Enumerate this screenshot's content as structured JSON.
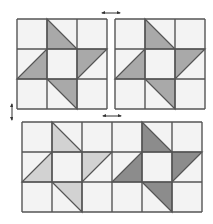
{
  "colors": {
    "background": "#ffffff",
    "cell": "#f3f3f3",
    "line": "#555555",
    "arrow": "#333333",
    "top_shade": "#a9a9a9",
    "bottom_left_shade": "#d2d2d2",
    "bottom_right_shade": "#8c8c8c"
  },
  "blocks": [
    {
      "name": "top-left-block",
      "x": 17,
      "y": 19,
      "cols": 3,
      "rows": 3,
      "cell": 30,
      "shade": "#a9a9a9"
    },
    {
      "name": "top-right-block",
      "x": 115,
      "y": 19,
      "cols": 3,
      "rows": 3,
      "cell": 30,
      "shade": "#a9a9a9"
    },
    {
      "name": "bottom-block",
      "x": 22,
      "y": 122,
      "cols": 6,
      "rows": 3,
      "cell": 30,
      "shade_left": "#d2d2d2",
      "shade_right": "#8c8c8c"
    }
  ],
  "pinwheel_triangles": [
    {
      "col": 1,
      "row": 0,
      "shape": "TL-BR-BL"
    },
    {
      "col": 0,
      "row": 1,
      "shape": "BL-TR-BR"
    },
    {
      "col": 2,
      "row": 1,
      "shape": "TL-TR-BL"
    },
    {
      "col": 1,
      "row": 2,
      "shape": "TL-TR-BR"
    }
  ],
  "arrows": [
    {
      "name": "horizontal-double-arrow-top",
      "orientation": "horizontal",
      "x": 111,
      "y": 13
    },
    {
      "name": "vertical-double-arrow-left",
      "orientation": "vertical",
      "x": 12,
      "y": 112
    },
    {
      "name": "horizontal-double-arrow-bottom",
      "orientation": "horizontal",
      "x": 112,
      "y": 116
    }
  ]
}
